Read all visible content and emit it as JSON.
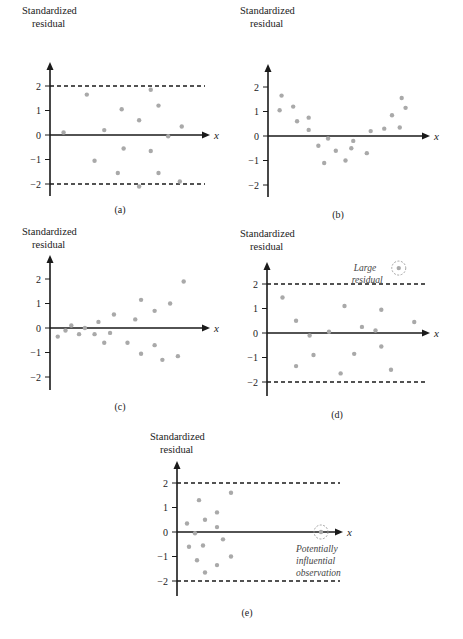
{
  "chart_data": [
    {
      "panel": "(a)",
      "type": "scatter",
      "title": "",
      "ylabel": "Standardized residual",
      "xlabel": "x",
      "yticks": [
        2,
        1,
        0,
        -1,
        -2
      ],
      "ylim": [
        -2.5,
        2.7
      ],
      "reference_lines": [
        2,
        -2
      ],
      "points": [
        [
          0.07,
          0.1
        ],
        [
          0.19,
          1.65
        ],
        [
          0.23,
          -1.05
        ],
        [
          0.28,
          0.2
        ],
        [
          0.37,
          1.05
        ],
        [
          0.38,
          -0.55
        ],
        [
          0.35,
          -1.55
        ],
        [
          0.46,
          0.6
        ],
        [
          0.46,
          -2.1
        ],
        [
          0.52,
          1.85
        ],
        [
          0.52,
          -0.65
        ],
        [
          0.56,
          1.2
        ],
        [
          0.56,
          -1.55
        ],
        [
          0.61,
          -0.05
        ],
        [
          0.68,
          0.35
        ],
        [
          0.67,
          -1.9
        ]
      ],
      "caption": "(a)"
    },
    {
      "panel": "(b)",
      "type": "scatter",
      "ylabel": "Standardized residual",
      "xlabel": "x",
      "yticks": [
        2,
        1,
        0,
        -1,
        -2
      ],
      "ylim": [
        -2.5,
        2.7
      ],
      "reference_lines": [],
      "points": [
        [
          0.06,
          1.05
        ],
        [
          0.07,
          1.65
        ],
        [
          0.13,
          1.2
        ],
        [
          0.15,
          0.6
        ],
        [
          0.21,
          0.75
        ],
        [
          0.21,
          0.25
        ],
        [
          0.26,
          -0.4
        ],
        [
          0.29,
          -1.1
        ],
        [
          0.31,
          -0.1
        ],
        [
          0.35,
          -0.6
        ],
        [
          0.4,
          -1.0
        ],
        [
          0.43,
          -0.5
        ],
        [
          0.44,
          -0.2
        ],
        [
          0.51,
          -0.7
        ],
        [
          0.53,
          0.2
        ],
        [
          0.6,
          0.3
        ],
        [
          0.64,
          0.85
        ],
        [
          0.68,
          0.35
        ],
        [
          0.69,
          1.55
        ],
        [
          0.71,
          1.15
        ]
      ],
      "caption": "(b)"
    },
    {
      "panel": "(c)",
      "type": "scatter",
      "ylabel": "Standardized residual",
      "xlabel": "x",
      "yticks": [
        2,
        1,
        0,
        -1,
        -2
      ],
      "ylim": [
        -2.5,
        2.7
      ],
      "reference_lines": [],
      "points": [
        [
          0.04,
          -0.35
        ],
        [
          0.08,
          -0.1
        ],
        [
          0.11,
          0.1
        ],
        [
          0.15,
          -0.25
        ],
        [
          0.18,
          0.0
        ],
        [
          0.23,
          -0.25
        ],
        [
          0.25,
          0.25
        ],
        [
          0.28,
          -0.6
        ],
        [
          0.31,
          -0.2
        ],
        [
          0.33,
          0.55
        ],
        [
          0.4,
          -0.6
        ],
        [
          0.44,
          0.35
        ],
        [
          0.47,
          1.15
        ],
        [
          0.47,
          -1.05
        ],
        [
          0.54,
          0.7
        ],
        [
          0.54,
          -0.7
        ],
        [
          0.58,
          -1.3
        ],
        [
          0.62,
          1.0
        ],
        [
          0.66,
          -1.15
        ],
        [
          0.69,
          1.9
        ]
      ],
      "caption": "(c)"
    },
    {
      "panel": "(d)",
      "type": "scatter",
      "ylabel": "Standardized residual",
      "xlabel": "x",
      "yticks": [
        2,
        1,
        0,
        -1,
        -2
      ],
      "ylim": [
        -2.5,
        2.7
      ],
      "reference_lines": [
        2,
        -2
      ],
      "points": [
        [
          0.08,
          1.45
        ],
        [
          0.15,
          0.5
        ],
        [
          0.15,
          -1.35
        ],
        [
          0.22,
          -0.1
        ],
        [
          0.24,
          -0.9
        ],
        [
          0.32,
          0.05
        ],
        [
          0.38,
          -1.65
        ],
        [
          0.4,
          1.1
        ],
        [
          0.45,
          -0.85
        ],
        [
          0.49,
          0.25
        ],
        [
          0.56,
          0.1
        ],
        [
          0.59,
          0.95
        ],
        [
          0.59,
          -0.55
        ],
        [
          0.64,
          -1.5
        ],
        [
          0.76,
          0.45
        ],
        [
          0.68,
          2.65
        ]
      ],
      "annotations": [
        {
          "text": "Large residual",
          "point": [
            0.68,
            2.65
          ]
        }
      ],
      "caption": "(d)"
    },
    {
      "panel": "(e)",
      "type": "scatter",
      "ylabel": "Standardized residual",
      "xlabel": "x",
      "yticks": [
        2,
        1,
        0,
        -1,
        -2
      ],
      "ylim": [
        -2.5,
        2.7
      ],
      "reference_lines": [
        2,
        -2
      ],
      "points": [
        [
          0.05,
          0.35
        ],
        [
          0.06,
          -0.6
        ],
        [
          0.09,
          -0.05
        ],
        [
          0.1,
          -1.15
        ],
        [
          0.11,
          1.3
        ],
        [
          0.13,
          -0.55
        ],
        [
          0.14,
          -1.65
        ],
        [
          0.14,
          0.5
        ],
        [
          0.2,
          0.8
        ],
        [
          0.2,
          0.2
        ],
        [
          0.2,
          -1.35
        ],
        [
          0.23,
          -0.3
        ],
        [
          0.27,
          1.6
        ],
        [
          0.27,
          -1.0
        ],
        [
          0.72,
          0.0
        ]
      ],
      "annotations": [
        {
          "text": "Potentially influential observation",
          "point": [
            0.72,
            0.0
          ]
        }
      ],
      "caption": "(e)"
    }
  ],
  "labels": {
    "ylabel_line1": "Standardized",
    "ylabel_line2": "residual",
    "xlabel": "x",
    "ticks": [
      "2",
      "1",
      "0",
      "−1",
      "−2"
    ],
    "captions": [
      "(a)",
      "(b)",
      "(c)",
      "(d)",
      "(e)"
    ],
    "note_d_line1": "Large",
    "note_d_line2": "residual",
    "note_e_line1": "Potentially",
    "note_e_line2": "influential",
    "note_e_line3": "observation"
  }
}
